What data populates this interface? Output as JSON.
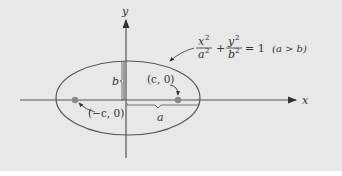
{
  "diagram": {
    "type": "ellipse",
    "axes": {
      "x_label": "x",
      "y_label": "y"
    },
    "equation": {
      "x_num": "x",
      "x_den": "a",
      "y_num": "y",
      "y_den": "b",
      "exp": "2",
      "rhs": "= 1",
      "condition": "(a > b)",
      "plus": "+"
    },
    "foci": {
      "left": "(−c, 0)",
      "right": "(c, 0)"
    },
    "semi_axes": {
      "major": "a",
      "minor": "b"
    },
    "colors": {
      "background": "#e8e8e8",
      "stroke": "#555555",
      "focus": "#888888"
    }
  }
}
